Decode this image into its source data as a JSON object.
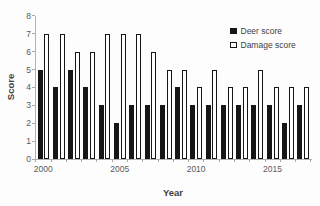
{
  "chart_data": {
    "type": "bar",
    "title": "",
    "xlabel": "Year",
    "ylabel": "Score",
    "ylim": [
      0,
      8
    ],
    "ytick_step": 1,
    "grid": false,
    "legend_position": "top-right",
    "categories": [
      "2000",
      "2001",
      "2002",
      "2003",
      "2004",
      "2005",
      "2006",
      "2007",
      "2008",
      "2009",
      "2010",
      "2011",
      "2012",
      "2013",
      "2014",
      "2015",
      "2016",
      "2017"
    ],
    "series": [
      {
        "name": "Deer score",
        "fill": "#161616",
        "border": "#161616",
        "values": [
          5,
          4,
          5,
          4,
          3,
          2,
          3,
          3,
          3,
          4,
          3,
          3,
          3,
          3,
          3,
          3,
          2,
          3
        ]
      },
      {
        "name": "Damage score",
        "fill": "#ffffff",
        "border": "#161616",
        "values": [
          7,
          7,
          6,
          6,
          7,
          7,
          7,
          6,
          5,
          5,
          4,
          5,
          4,
          4,
          5,
          4,
          4,
          4
        ]
      }
    ],
    "x_tick_labels_shown": [
      {
        "label": "2000",
        "index": 0
      },
      {
        "label": "2005",
        "index": 5
      },
      {
        "label": "2010",
        "index": 10
      },
      {
        "label": "2015",
        "index": 15
      }
    ],
    "colors": {
      "axis_line": "#b3b3b3",
      "tick_text": "#595959",
      "title_text": "#3f3f3f",
      "background": "#fdfdfd"
    }
  }
}
